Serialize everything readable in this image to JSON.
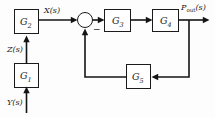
{
  "diagram": {
    "background_color": "#fdfdfd",
    "line_color": "#141414",
    "box_fill": "#ffffff",
    "blocks": [
      {
        "id": "G1",
        "label": "G",
        "sub": "1"
      },
      {
        "id": "G2",
        "label": "G",
        "sub": "2"
      },
      {
        "id": "G3",
        "label": "G",
        "sub": "3"
      },
      {
        "id": "G4",
        "label": "G",
        "sub": "4"
      },
      {
        "id": "G5",
        "label": "G",
        "sub": "5"
      }
    ],
    "signals": {
      "input": "Y(s)",
      "intermediate_z": "Z(s)",
      "intermediate_x": "X(s)",
      "output_main": "P",
      "output_sub": "out",
      "output_tail": "(s)"
    },
    "summing_junction": {
      "name": "summing-junction",
      "negative_sign": "−"
    }
  }
}
